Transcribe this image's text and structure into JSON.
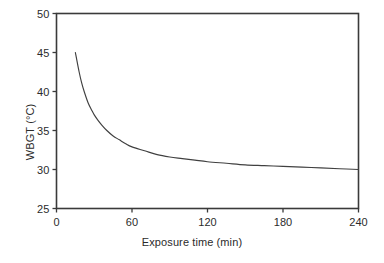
{
  "figure": {
    "background_color": "#ffffff",
    "axis_color": "#3a3a3a",
    "line_color": "#404040"
  },
  "axis_titles": {
    "x": "Exposure time (min)",
    "y": "WBGT (°C)"
  },
  "ticks": {
    "x": [
      "0",
      "60",
      "120",
      "180",
      "240"
    ],
    "y": [
      "25",
      "30",
      "35",
      "40",
      "45",
      "50"
    ]
  },
  "chart_data": {
    "type": "line",
    "title": "",
    "subtitle": "",
    "xlabel": "Exposure time (min)",
    "ylabel": "WBGT (°C)",
    "xlim": [
      0,
      240
    ],
    "ylim": [
      25,
      50
    ],
    "xticks": [
      0,
      60,
      120,
      180,
      240
    ],
    "yticks": [
      25,
      30,
      35,
      40,
      45,
      50
    ],
    "grid": false,
    "legend": null,
    "legend_position": "none",
    "annotations": [],
    "series": [
      {
        "name": "WBGT exposure limit",
        "color": "#404040",
        "x": [
          15,
          18,
          20,
          22,
          25,
          28,
          30,
          33,
          36,
          40,
          45,
          50,
          55,
          60,
          70,
          80,
          90,
          100,
          110,
          120,
          135,
          150,
          165,
          180,
          195,
          210,
          225,
          240
        ],
        "y": [
          45.0,
          42.5,
          41.1,
          40.0,
          38.6,
          37.6,
          37.0,
          36.3,
          35.7,
          35.0,
          34.3,
          33.8,
          33.3,
          32.9,
          32.4,
          31.9,
          31.6,
          31.4,
          31.2,
          31.0,
          30.8,
          30.6,
          30.5,
          30.4,
          30.3,
          30.2,
          30.1,
          30.0
        ]
      }
    ]
  }
}
